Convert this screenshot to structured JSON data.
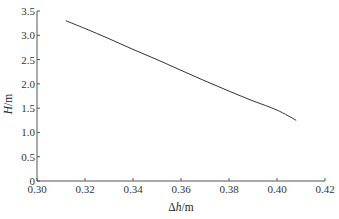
{
  "chart_data": {
    "type": "line",
    "title": "",
    "xlabel": "Δh/m",
    "xlabel_parts": {
      "prefix": "Δ",
      "var": "h",
      "unit": "/m"
    },
    "ylabel": "H/m",
    "ylabel_parts": {
      "var": "H",
      "unit": "/m"
    },
    "xlim": [
      0.3,
      0.42
    ],
    "ylim": [
      0,
      3.5
    ],
    "x_ticks": [
      0.3,
      0.32,
      0.34,
      0.36,
      0.38,
      0.4,
      0.42
    ],
    "x_tick_labels": [
      "0.30",
      "0.32",
      "0.34",
      "0.36",
      "0.38",
      "0.40",
      "0.42"
    ],
    "y_ticks": [
      0,
      0.5,
      1.0,
      1.5,
      2.0,
      2.5,
      3.0,
      3.5
    ],
    "y_tick_labels": [
      "0",
      "0.5",
      "1.0",
      "1.5",
      "2.0",
      "2.5",
      "3.0",
      "3.5"
    ],
    "grid": false,
    "legend": null,
    "series": [
      {
        "name": "H",
        "color": "#333333",
        "x": [
          0.312,
          0.32,
          0.33,
          0.34,
          0.35,
          0.36,
          0.37,
          0.38,
          0.39,
          0.4,
          0.408
        ],
        "y": [
          3.3,
          3.14,
          2.93,
          2.71,
          2.5,
          2.28,
          2.06,
          1.85,
          1.65,
          1.46,
          1.25
        ]
      }
    ]
  },
  "style": {
    "axis_color": "#555555",
    "line_color": "#333333",
    "background": "#ffffff"
  }
}
